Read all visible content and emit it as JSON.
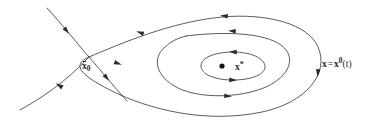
{
  "figure": {
    "kind": "phase-portrait",
    "background_color": "#ffffff",
    "stroke_color": "#3d3d46",
    "label_color": "#2a2a32",
    "width": 371,
    "height": 128
  },
  "labels": {
    "initial_point": {
      "symbol": "x",
      "subscript": "0",
      "overbar": true,
      "text": "x̄0"
    },
    "fixed_point": {
      "symbol": "x",
      "superscript": "*",
      "text": "x*"
    },
    "solution_curve": {
      "lhs": "x",
      "equals": "=",
      "rhs_symbol": "x",
      "rhs_superscript": "0",
      "rhs_argument": "(t)",
      "text": "x = x0(t)"
    }
  },
  "chart_data": {
    "type": "line",
    "title": "",
    "xlabel": "",
    "ylabel": "",
    "grid": false,
    "legend": false,
    "series": [
      {
        "name": "outer-orbit",
        "role": "closed-periodic-orbit",
        "closed": true,
        "label": "x = x0(t)",
        "orientation": "clockwise-on-screen",
        "path": "M 89 57 C 120 44 170 22 222 17 C 268 13 308 24 318 47 C 330 74 305 103 262 112 C 205 124 148 109 112 91 C 82 76 70 65 89 57 Z",
        "arrow_positions": [
          {
            "x": 141,
            "y": 33,
            "angle": 200
          },
          {
            "x": 225,
            "y": 16,
            "angle": 186
          },
          {
            "x": 318,
            "y": 72,
            "angle": 95
          },
          {
            "x": 117,
            "y": 63,
            "angle": 20
          }
        ]
      },
      {
        "name": "middle-orbit",
        "role": "closed-periodic-orbit",
        "closed": true,
        "orientation": "clockwise-on-screen",
        "path": "M 186 36 C 226 31 264 33 281 45 C 297 57 290 76 266 87 C 238 99 198 98 178 88 C 156 77 152 59 164 48 C 170 42 177 38 186 36 Z",
        "arrow_positions": [
          {
            "x": 233,
            "y": 31,
            "angle": 184
          },
          {
            "x": 227,
            "y": 96,
            "angle": 5
          }
        ]
      },
      {
        "name": "inner-orbit",
        "role": "closed-periodic-orbit",
        "closed": true,
        "orientation": "clockwise-on-screen",
        "path": "M 233 52 C 251 52 264 58 265 66 C 266 74 252 80 233 80 C 214 80 201 74 201 66 C 201 58 214 52 233 52 Z",
        "arrow_positions": [
          {
            "x": 234,
            "y": 52,
            "angle": 182
          },
          {
            "x": 232,
            "y": 80,
            "angle": 2
          }
        ]
      },
      {
        "name": "transversal-trajectory",
        "role": "non-periodic-trajectory",
        "closed": false,
        "path": "M 47 8 C 60 22 76 42 89 57 C 103 73 115 88 127 101",
        "arrow_positions": [
          {
            "x": 66,
            "y": 30,
            "angle": 50
          },
          {
            "x": 106,
            "y": 77,
            "angle": 50
          }
        ]
      },
      {
        "name": "lower-incoming-branch",
        "role": "orbit-tail",
        "closed": false,
        "path": "M 20 110 C 40 99 66 82 89 57",
        "arrow_positions": [
          {
            "x": 60,
            "y": 86,
            "angle": 212
          }
        ]
      }
    ],
    "points": [
      {
        "name": "fixed-point",
        "label": "x*",
        "x": 222,
        "y": 66,
        "radius": 2.6,
        "color": "#111118"
      }
    ],
    "annotations": [
      {
        "name": "initial-point-label",
        "text": "x̄0",
        "x": 82,
        "y": 62
      },
      {
        "name": "fixed-point-label",
        "text": "x*",
        "x": 235,
        "y": 61
      },
      {
        "name": "solution-curve-label",
        "text": "x = x0(t)",
        "x": 322,
        "y": 57
      }
    ]
  }
}
